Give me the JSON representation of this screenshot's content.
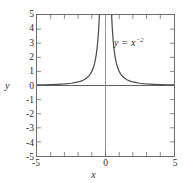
{
  "figure": {
    "background_color": "#ffffff",
    "frame_color": "#6b6b6b",
    "curve_color": "#4d4d4d",
    "axis_color": "#4d4d4d",
    "text_color": "#2b2b2b"
  },
  "chart_data": {
    "type": "line",
    "title": "",
    "xlabel": "x",
    "ylabel": "y",
    "annotation": "y = x",
    "annotation_exponent": "−2",
    "annotation_full": "y = x⁻²",
    "function": "y = x^-2",
    "xlim": [
      -5,
      5
    ],
    "ylim": [
      -5,
      5
    ],
    "grid": false,
    "legend": null,
    "xticks_major": [
      -5,
      0,
      5
    ],
    "xticks_major_labels": [
      "-5",
      "0",
      "5"
    ],
    "xticks_minor": [
      -4,
      -3,
      -2,
      -1,
      1,
      2,
      3,
      4
    ],
    "yticks_major": [
      5,
      4,
      3,
      2,
      1,
      0,
      -1,
      -2,
      -3,
      -4,
      -5
    ],
    "yticks_major_labels": [
      "5",
      "4",
      "3",
      "2",
      "1",
      "0",
      "-1",
      "-2",
      "-3",
      "-4",
      "-5"
    ],
    "asymptotes": {
      "vertical": [
        0
      ],
      "horizontal": [
        0
      ]
    },
    "series": [
      {
        "name": "y = x^-2 (left branch)",
        "x": [
          -5.0,
          -4.5,
          -4.0,
          -3.5,
          -3.0,
          -2.75,
          -2.5,
          -2.25,
          -2.0,
          -1.8,
          -1.6,
          -1.4,
          -1.2,
          -1.1,
          -1.0,
          -0.9,
          -0.8,
          -0.75,
          -0.7,
          -0.65,
          -0.6,
          -0.55,
          -0.5,
          -0.48,
          -0.46,
          -0.45
        ],
        "y": [
          0.04,
          0.049,
          0.063,
          0.082,
          0.111,
          0.132,
          0.16,
          0.198,
          0.25,
          0.309,
          0.391,
          0.51,
          0.694,
          0.826,
          1.0,
          1.235,
          1.563,
          1.778,
          2.041,
          2.367,
          2.778,
          3.306,
          4.0,
          4.34,
          4.726,
          4.938
        ]
      },
      {
        "name": "y = x^-2 (right branch)",
        "x": [
          0.45,
          0.46,
          0.48,
          0.5,
          0.55,
          0.6,
          0.65,
          0.7,
          0.75,
          0.8,
          0.9,
          1.0,
          1.1,
          1.2,
          1.4,
          1.6,
          1.8,
          2.0,
          2.25,
          2.5,
          2.75,
          3.0,
          3.5,
          4.0,
          4.5,
          5.0
        ],
        "y": [
          4.938,
          4.726,
          4.34,
          4.0,
          3.306,
          2.778,
          2.367,
          2.041,
          1.778,
          1.563,
          1.235,
          1.0,
          0.826,
          0.694,
          0.51,
          0.391,
          0.309,
          0.25,
          0.198,
          0.16,
          0.132,
          0.111,
          0.082,
          0.063,
          0.049,
          0.04
        ]
      }
    ]
  }
}
